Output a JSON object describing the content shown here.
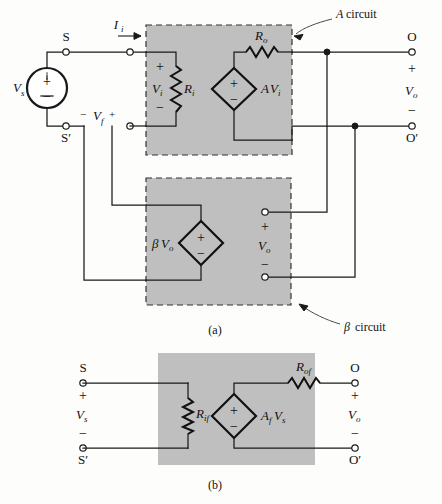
{
  "figure": {
    "caption_a": "(a)",
    "caption_b": "(b)",
    "annotations": {
      "a_circuit_italic": "A",
      "a_circuit_rest": "circuit",
      "beta_circuit_symbol": "β",
      "beta_circuit_rest": "circuit"
    }
  },
  "panel_a": {
    "source": {
      "label": "V",
      "label_sub": "s",
      "plus": "+",
      "minus": "−"
    },
    "terminals": {
      "s": "S",
      "s_prime": "S′",
      "o": "O",
      "o_prime": "O′"
    },
    "input_current": {
      "label": "I",
      "label_sub": "i"
    },
    "feedback_voltage": {
      "minus_sign": "−",
      "label": "V",
      "label_sub": "f",
      "plus_sign": "+"
    },
    "a_circuit": {
      "input_voltage": {
        "label": "V",
        "label_sub": "i",
        "plus": "+",
        "minus": "−"
      },
      "input_resistance": {
        "label": "R",
        "label_sub": "i"
      },
      "output_resistance": {
        "label": "R",
        "label_sub": "o"
      },
      "controlled_source": {
        "label_gain": "A",
        "label_v": "V",
        "label_sub": "i",
        "plus": "+",
        "minus": "−"
      }
    },
    "beta_circuit": {
      "controlled_source": {
        "label_beta": "β",
        "label_v": "V",
        "label_sub": "o",
        "plus": "+",
        "minus": "−"
      },
      "output_voltage": {
        "label": "V",
        "label_sub": "o",
        "plus": "+",
        "minus": "−"
      }
    },
    "output_voltage": {
      "label": "V",
      "label_sub": "o",
      "plus": "+",
      "minus": "−"
    }
  },
  "panel_b": {
    "terminals": {
      "s": "S",
      "s_prime": "S′",
      "o": "O",
      "o_prime": "O′"
    },
    "source_voltage": {
      "label": "V",
      "label_sub": "s",
      "plus": "+",
      "minus": "−"
    },
    "output_voltage": {
      "label": "V",
      "label_sub": "o",
      "plus": "+",
      "minus": "−"
    },
    "input_resistance": {
      "label": "R",
      "label_sub": "if"
    },
    "output_resistance": {
      "label": "R",
      "label_sub": "of"
    },
    "controlled_source": {
      "label_gain": "A",
      "label_gain_sub": "f",
      "label_v": "V",
      "label_v_sub": "s",
      "plus": "+",
      "minus": "−"
    }
  },
  "colors": {
    "box_fill": "#bfbfbf",
    "wire": "#1a1a1a",
    "background": "#fdfdfc"
  }
}
